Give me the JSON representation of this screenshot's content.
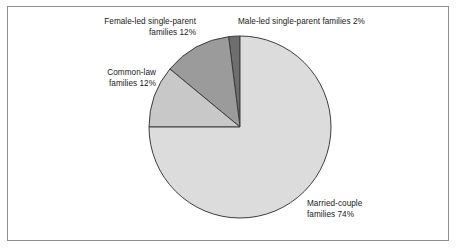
{
  "figure": {
    "background_color": "#ffffff",
    "frame_color": "#8e8e8e",
    "text_color": "#1a1a1a"
  },
  "chart_data": {
    "type": "pie",
    "title": "",
    "subtitle": "",
    "xlabel": "",
    "ylabel": "",
    "legend_position": "none",
    "grid": false,
    "start_angle_deg": 90,
    "direction": "counterclockwise",
    "center": {
      "x": 240,
      "y": 127
    },
    "radius": 91,
    "units": "percent",
    "total": 100,
    "categories": [
      "Male-led single-parent families",
      "Female-led single-parent families",
      "Common-law families",
      "Married-couple families"
    ],
    "values": [
      2,
      12,
      12,
      74
    ],
    "colors": [
      "#6e6e6e",
      "#9b9b9b",
      "#c8c8c8",
      "#dcdcdc"
    ],
    "slice_edge_color": "#3d3d3d",
    "slices": [
      {
        "name": "male-led-single-parent",
        "label_line_1": "Male-led single-parent families 2%",
        "label_line_2": "",
        "value": 2,
        "color": "#6e6e6e",
        "start_angle_deg": 90,
        "end_angle_deg": 97.2
      },
      {
        "name": "female-led-single-parent",
        "label_line_1": "Female-led single-parent",
        "label_line_2": "families 12%",
        "value": 12,
        "color": "#9b9b9b",
        "start_angle_deg": 97.2,
        "end_angle_deg": 140.4
      },
      {
        "name": "common-law",
        "label_line_1": "Common-law",
        "label_line_2": "families 12%",
        "value": 12,
        "color": "#c8c8c8",
        "start_angle_deg": 140.4,
        "end_angle_deg": 180
      },
      {
        "name": "married-couple",
        "label_line_1": "Married-couple",
        "label_line_2": "families 74%",
        "value": 74,
        "color": "#dcdcdc",
        "start_angle_deg": 180,
        "end_angle_deg": 450
      }
    ],
    "labels": {
      "female_led": "Female-led single-parent\nfamilies 12%",
      "male_led": "Male-led single-parent families 2%",
      "common_law": "Common-law\nfamilies 12%",
      "married_couple": "Married-couple\nfamilies 74%"
    }
  }
}
